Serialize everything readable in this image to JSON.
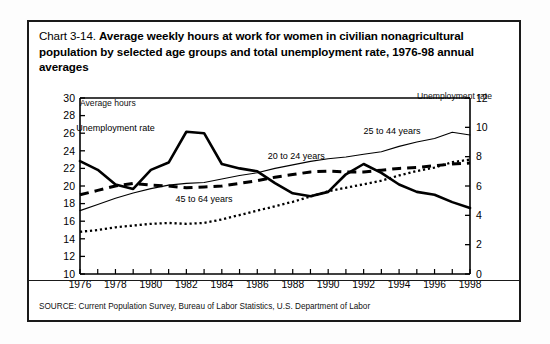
{
  "figure": {
    "title_prefix": "Chart 3-14.",
    "title_main": "Average weekly hours at work for women in civilian nonagricultural population by selected age groups and total unemployment rate, 1976-98 annual averages",
    "left_axis_title": "Average hours",
    "right_axis_title": "Unemployment rate",
    "source": "SOURCE: Current Population Survey, Bureau of Labor Statistics, U.S. Department of Labor",
    "border_color": "#1a1a1a"
  },
  "chart_data": {
    "type": "line",
    "title": "Chart 3-14. Average weekly hours at work for women in civilian nonagricultural population by selected age groups and total unemployment rate, 1976-98 annual averages",
    "xlabel": "",
    "ylabel": "Average hours",
    "y2label": "Unemployment rate",
    "xlim": [
      1976,
      1998
    ],
    "ylim": [
      10,
      30
    ],
    "y2lim": [
      0,
      12
    ],
    "yticks": [
      10,
      12,
      14,
      16,
      18,
      20,
      22,
      24,
      26,
      28,
      30
    ],
    "y2ticks": [
      0,
      2,
      4,
      6,
      8,
      10,
      12
    ],
    "xticks": [
      1976,
      1977,
      1978,
      1979,
      1980,
      1981,
      1982,
      1983,
      1984,
      1985,
      1986,
      1987,
      1988,
      1989,
      1990,
      1991,
      1992,
      1993,
      1994,
      1995,
      1996,
      1997,
      1998
    ],
    "xticklabels": [
      "1976",
      "1978",
      "1980",
      "1982",
      "1984",
      "1986",
      "1988",
      "1990",
      "1992",
      "1994",
      "1996",
      "1998"
    ],
    "xticklabel_years": [
      1976,
      1978,
      1980,
      1982,
      1984,
      1986,
      1988,
      1990,
      1992,
      1994,
      1996,
      1998
    ],
    "grid": false,
    "legend_position": "inline-annotations",
    "x": [
      1976,
      1977,
      1978,
      1979,
      1980,
      1981,
      1982,
      1983,
      1984,
      1985,
      1986,
      1987,
      1988,
      1989,
      1990,
      1991,
      1992,
      1993,
      1994,
      1995,
      1996,
      1997,
      1998
    ],
    "series": [
      {
        "name": "Unemployment rate",
        "axis": "right",
        "style": "thick-solid",
        "units": "percent",
        "label_x": 1978.0,
        "label_y": 26.3,
        "values": [
          7.7,
          7.1,
          6.1,
          5.8,
          7.1,
          7.6,
          9.7,
          9.6,
          7.5,
          7.2,
          7.0,
          6.2,
          5.5,
          5.3,
          5.6,
          6.8,
          7.5,
          6.9,
          6.1,
          5.6,
          5.4,
          4.9,
          4.5
        ]
      },
      {
        "name": "25 to 44 years",
        "axis": "left",
        "style": "thin-solid",
        "units": "hours",
        "label_x": 1993.6,
        "label_y": 25.9,
        "values": [
          17.2,
          17.9,
          18.6,
          19.2,
          19.7,
          20.1,
          20.3,
          20.4,
          20.8,
          21.2,
          21.5,
          22.0,
          22.4,
          22.8,
          23.1,
          23.3,
          23.6,
          23.9,
          24.5,
          25.0,
          25.4,
          26.1,
          25.8
        ]
      },
      {
        "name": "20 to 24 years",
        "axis": "left",
        "style": "thick-dashed",
        "units": "hours",
        "label_x": 1988.2,
        "label_y": 23.1,
        "values": [
          19.0,
          19.5,
          20.0,
          20.3,
          20.1,
          20.0,
          19.8,
          19.9,
          20.0,
          20.3,
          20.6,
          21.0,
          21.3,
          21.6,
          21.7,
          21.6,
          21.6,
          21.8,
          22.0,
          22.1,
          22.3,
          22.5,
          22.6
        ]
      },
      {
        "name": "45 to 64 years",
        "axis": "left",
        "style": "dotted",
        "units": "hours",
        "label_x": 1983.0,
        "label_y": 18.2,
        "values": [
          14.8,
          15.0,
          15.3,
          15.5,
          15.7,
          15.8,
          15.7,
          15.8,
          16.2,
          16.7,
          17.2,
          17.7,
          18.2,
          18.8,
          19.4,
          19.8,
          20.2,
          20.6,
          21.2,
          21.7,
          22.1,
          22.7,
          23.0
        ]
      }
    ]
  }
}
